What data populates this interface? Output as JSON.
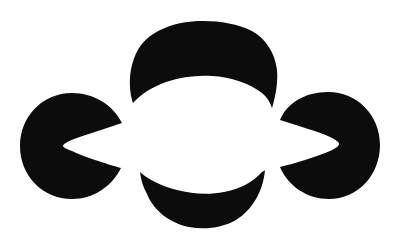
{
  "figure": {
    "kind": "subjective-figure",
    "canvas": {
      "width": 402,
      "height": 243,
      "background_color": "#ffffff",
      "ink_color": "#0d0c0c"
    },
    "inducers": [
      {
        "name": "left-pacman-inducer",
        "role": "left",
        "shape": "disk-with-wedge-notch",
        "notch_direction": "right",
        "center_x": 72,
        "center_y": 146,
        "radius": 53,
        "notch_tip_x": 69,
        "notch_tip_y": 146,
        "fill": "#0d0c0c"
      },
      {
        "name": "top-crescent-inducer",
        "role": "top",
        "shape": "disk-with-arc-bite",
        "notch_direction": "down",
        "center_x": 203,
        "center_y": 96,
        "radius": 75,
        "horn_left_x": 133,
        "horn_left_y": 103,
        "horn_right_x": 272,
        "horn_right_y": 108,
        "fill": "#0d0c0c"
      },
      {
        "name": "bottom-halfdisk-inducer",
        "role": "bottom",
        "shape": "disk-with-arc-bite",
        "notch_direction": "up",
        "center_x": 203,
        "center_y": 170,
        "radius": 62,
        "top_left_x": 140,
        "top_left_y": 172,
        "top_right_x": 265,
        "top_right_y": 170,
        "bottom_y": 228,
        "fill": "#0d0c0c"
      },
      {
        "name": "right-pacman-inducer",
        "role": "right",
        "shape": "disk-with-wedge-notch",
        "notch_direction": "left",
        "center_x": 328,
        "center_y": 144,
        "radius": 52,
        "notch_tip_x": 332,
        "notch_tip_y": 145,
        "fill": "#0d0c0c"
      }
    ],
    "perceived_region": {
      "name": "illusory-center-region",
      "fill": "#ffffff",
      "center_x": 203,
      "center_y": 141
    },
    "paths": {
      "left_inducer_d": "M 72 93 C 42 93 20 117 20 146 C 20 176 43 199 72 199 C 94 199 112 186 121 168 C 114 166 104 163 95 160 C 86 157 78 154 72 151 C 66 149 63 147 63 146 C 63 144 67 142 74 139 C 82 136 92 133 101 130 C 109 127 116 125 122 123 C 113 105 94 93 72 93 Z",
      "top_inducer_d": "M 203 21 C 174 21 150 31 139 48 C 131 61 128 78 131 96 C 132 99 132 101 133 103 C 141 94 152 87 166 82 C 181 77 197 75 212 76 C 231 77 249 83 262 93 C 267 97 270 102 272 108 C 276 95 278 82 277 70 C 275 53 266 39 252 31 C 238 24 221 21 203 21 Z",
      "bottom_inducer_d": "M 140 172 C 149 180 162 186 177 190 C 192 194 209 195 224 192 C 240 189 253 182 262 172 C 264 171 265 170 265 170 C 263 192 252 210 236 220 C 222 228 205 230 189 227 C 170 223 154 211 147 194 C 143 187 141 180 140 172 Z",
      "right_inducer_d": "M 328 92 C 305 92 287 103 280 120 C 287 122 296 125 305 128 C 315 131 324 134 330 137 C 336 140 339 142 339 144 C 339 146 336 148 330 151 C 323 154 314 157 305 160 C 296 163 287 165 280 167 C 288 186 307 199 329 199 C 358 199 380 175 380 145 C 380 115 357 92 328 92 Z"
    }
  }
}
